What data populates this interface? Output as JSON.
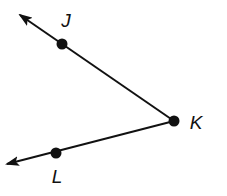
{
  "diagram": {
    "type": "angle",
    "stroke_color": "#111111",
    "background": "#ffffff",
    "vertex": {
      "name": "K",
      "label": "K",
      "x": 174,
      "y": 121,
      "label_x": 196,
      "label_y": 122
    },
    "points": [
      {
        "name": "J",
        "label": "J",
        "x": 62,
        "y": 44,
        "label_x": 66,
        "label_y": 20
      },
      {
        "name": "L",
        "label": "L",
        "x": 56,
        "y": 153,
        "label_x": 57,
        "label_y": 176
      }
    ],
    "rays": [
      {
        "name": "ray-KJ",
        "from": "K",
        "through": "J",
        "arrow_tip": {
          "x": 20,
          "y": 15
        }
      },
      {
        "name": "ray-KL",
        "from": "K",
        "through": "L",
        "arrow_tip": {
          "x": 7,
          "y": 164
        }
      }
    ]
  }
}
